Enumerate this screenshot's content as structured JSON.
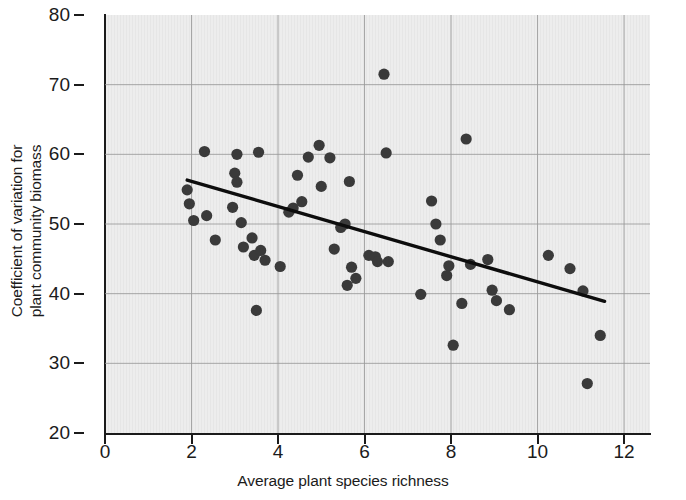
{
  "chart_data": {
    "type": "scatter",
    "title": "",
    "xlabel": "Average plant species richness",
    "ylabel": "Coefficient of variation for\nplant community biomass",
    "xlim": [
      0,
      12.6
    ],
    "ylim": [
      20,
      80
    ],
    "xticks": [
      0,
      2,
      4,
      6,
      8,
      10,
      12
    ],
    "xtick_labels": [
      "0",
      "2",
      "4",
      "6",
      "8",
      "10",
      "12"
    ],
    "yticks": [
      20,
      30,
      40,
      50,
      60,
      70,
      80
    ],
    "ytick_labels": [
      "20",
      "30",
      "40",
      "50",
      "60",
      "70",
      "80"
    ],
    "grid": true,
    "grid_color": "#9a9a9a",
    "panel_color": "#ededed",
    "point_color": "#3a3a3a",
    "trendline_color": "#0d0d0d",
    "legend": null,
    "series": [
      {
        "name": "sites",
        "marker": "circle",
        "points": [
          [
            1.9,
            54.9
          ],
          [
            1.95,
            52.9
          ],
          [
            2.05,
            50.5
          ],
          [
            2.3,
            60.4
          ],
          [
            2.35,
            51.2
          ],
          [
            2.55,
            47.7
          ],
          [
            2.95,
            52.4
          ],
          [
            3.0,
            57.3
          ],
          [
            3.05,
            56.0
          ],
          [
            3.05,
            60.0
          ],
          [
            3.15,
            50.2
          ],
          [
            3.2,
            46.7
          ],
          [
            3.4,
            48.0
          ],
          [
            3.45,
            45.5
          ],
          [
            3.5,
            37.6
          ],
          [
            3.55,
            60.3
          ],
          [
            3.6,
            46.2
          ],
          [
            3.7,
            44.8
          ],
          [
            4.05,
            43.9
          ],
          [
            4.25,
            51.7
          ],
          [
            4.35,
            52.3
          ],
          [
            4.45,
            57.0
          ],
          [
            4.55,
            53.2
          ],
          [
            4.7,
            59.6
          ],
          [
            4.95,
            61.3
          ],
          [
            5.0,
            55.4
          ],
          [
            5.2,
            59.5
          ],
          [
            5.3,
            46.4
          ],
          [
            5.45,
            49.5
          ],
          [
            5.55,
            50.0
          ],
          [
            5.6,
            41.2
          ],
          [
            5.65,
            56.1
          ],
          [
            5.7,
            43.8
          ],
          [
            5.8,
            42.2
          ],
          [
            6.1,
            45.5
          ],
          [
            6.25,
            45.3
          ],
          [
            6.3,
            44.6
          ],
          [
            6.45,
            71.5
          ],
          [
            6.5,
            60.2
          ],
          [
            6.55,
            44.6
          ],
          [
            7.3,
            39.9
          ],
          [
            7.55,
            53.3
          ],
          [
            7.65,
            50.0
          ],
          [
            7.75,
            47.7
          ],
          [
            7.95,
            44.0
          ],
          [
            7.9,
            42.6
          ],
          [
            8.05,
            32.6
          ],
          [
            8.25,
            38.6
          ],
          [
            8.35,
            62.2
          ],
          [
            8.45,
            44.2
          ],
          [
            8.85,
            44.9
          ],
          [
            8.95,
            40.5
          ],
          [
            9.05,
            39.0
          ],
          [
            9.35,
            37.7
          ],
          [
            10.25,
            45.5
          ],
          [
            10.75,
            43.6
          ],
          [
            11.05,
            40.4
          ],
          [
            11.15,
            27.1
          ],
          [
            11.45,
            34.0
          ]
        ]
      }
    ],
    "trendline": {
      "x0": 1.9,
      "y0": 56.3,
      "x1": 11.55,
      "y1": 38.9
    }
  }
}
